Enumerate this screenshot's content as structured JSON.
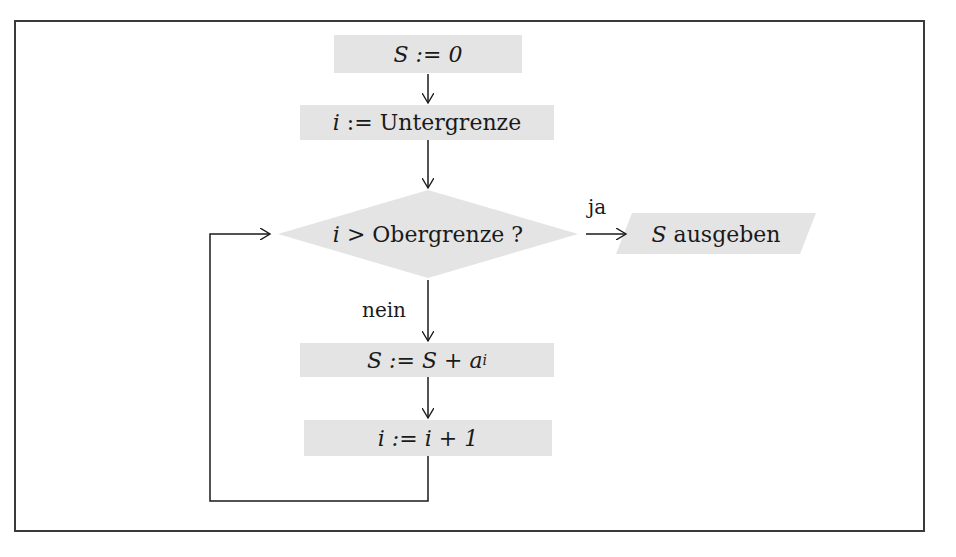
{
  "diagram": {
    "type": "flowchart",
    "nodes": {
      "init_s": {
        "shape": "process",
        "text": "S := 0"
      },
      "init_i": {
        "shape": "process",
        "var": "i",
        "op": ":=",
        "rest": "Untergrenze"
      },
      "decision": {
        "shape": "decision",
        "var": "i",
        "op": ">",
        "rest": "Obergrenze ?"
      },
      "output": {
        "shape": "io",
        "var": "S",
        "rest": "ausgeben"
      },
      "accumulate": {
        "shape": "process",
        "lhs": "S := S + a",
        "sub": "i"
      },
      "increment": {
        "shape": "process",
        "text": "i := i + 1"
      }
    },
    "edge_labels": {
      "yes": "ja",
      "no": "nein"
    },
    "edges": [
      {
        "from": "init_s",
        "to": "init_i"
      },
      {
        "from": "init_i",
        "to": "decision"
      },
      {
        "from": "decision",
        "to": "output",
        "label": "ja"
      },
      {
        "from": "decision",
        "to": "accumulate",
        "label": "nein"
      },
      {
        "from": "accumulate",
        "to": "increment"
      },
      {
        "from": "increment",
        "to": "decision",
        "type": "loop-back"
      }
    ],
    "colors": {
      "node_fill": "#e4e4e4",
      "line": "#1a1a1a",
      "frame": "#3a3a3a"
    }
  }
}
